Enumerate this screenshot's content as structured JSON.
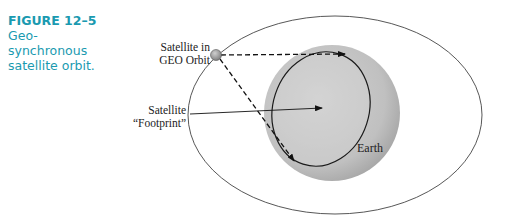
{
  "figure": {
    "number": "FIGURE 12–5",
    "caption_lines": [
      "Geo-",
      "synchronous",
      "satellite orbit."
    ]
  },
  "diagram": {
    "labels": {
      "satellite_line1": "Satellite in",
      "satellite_line2": "GEO Orbit",
      "footprint_line1": "Satellite",
      "footprint_line2": "“Footprint”",
      "earth": "Earth"
    },
    "colors": {
      "caption": "#1a9ab0",
      "earth_fill": "#bdbdbd",
      "orbit_stroke": "#444444",
      "satellite_fill": "#9a9a9a"
    }
  }
}
